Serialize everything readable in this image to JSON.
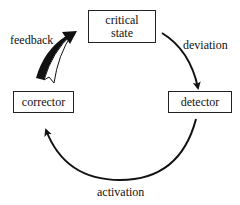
{
  "diagram": {
    "type": "feedback-cycle",
    "nodes": [
      {
        "id": "critical-state",
        "label_line1": "critical",
        "label_line2": "state"
      },
      {
        "id": "detector",
        "label": "detector"
      },
      {
        "id": "corrector",
        "label": "corrector"
      }
    ],
    "edges": [
      {
        "from": "critical-state",
        "to": "detector",
        "label": "deviation"
      },
      {
        "from": "detector",
        "to": "corrector",
        "label": "activation"
      },
      {
        "from": "corrector",
        "to": "critical-state",
        "label": "feedback"
      }
    ],
    "colors": {
      "stroke": "#111111",
      "background": "#ffffff"
    }
  }
}
